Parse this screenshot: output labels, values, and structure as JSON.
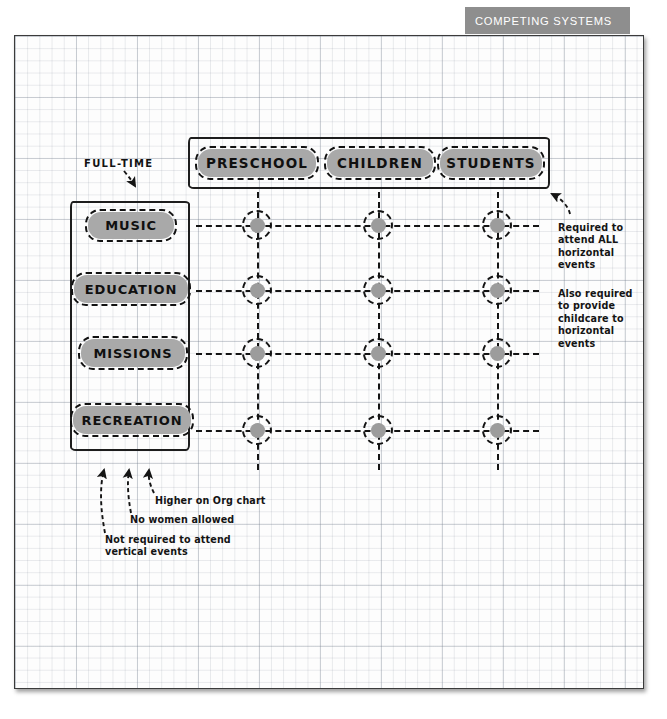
{
  "header": {
    "banner_title": "COMPETING SYSTEMS",
    "banner_color": "#8e8e8e",
    "banner_text_color": "#ffffff"
  },
  "diagram": {
    "title": "Competing Systems",
    "chip_fill": "#a9a9a9",
    "ink_color": "#141414",
    "full_time_label": "FULL-TIME",
    "top_group": {
      "name": "horizontal-systems",
      "items": [
        {
          "label": "PRESCHOOL"
        },
        {
          "label": "CHILDREN"
        },
        {
          "label": "STUDENTS"
        }
      ]
    },
    "left_group": {
      "name": "vertical-systems",
      "items": [
        {
          "label": "MUSIC"
        },
        {
          "label": "EDUCATION"
        },
        {
          "label": "MISSIONS"
        },
        {
          "label": "RECREATION"
        }
      ]
    },
    "intersections": {
      "rows": 4,
      "columns": 3,
      "count": 12
    },
    "annotations_right": [
      {
        "name": "required-attend-all",
        "text": "Required to\nattend ALL\nhorizontal\nevents"
      },
      {
        "name": "required-childcare",
        "text": "Also required\nto provide\nchildcare to\nhorizontal\nevents"
      }
    ],
    "annotations_bottom": [
      {
        "name": "higher-on-org-chart",
        "text": "Higher on Org chart"
      },
      {
        "name": "no-women-allowed",
        "text": "No women allowed"
      },
      {
        "name": "not-required-vertical",
        "text": "Not required to attend\nvertical events"
      }
    ]
  }
}
